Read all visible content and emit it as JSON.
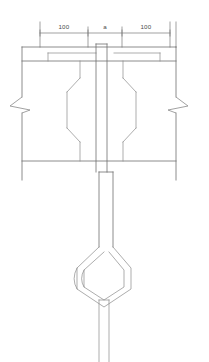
{
  "drawing": {
    "title": "Structural connection detail - section view",
    "units_note": "",
    "line_color": "#6e6e6e",
    "thin_line_color": "#8a8a8a",
    "text_color": "#4a4a4a",
    "background": "#ffffff"
  },
  "dimensions": {
    "chain_label": "dimension-chain",
    "segments": [
      {
        "id": "left",
        "label": "100",
        "x_start": 40,
        "x_end": 88,
        "text_x": 64
      },
      {
        "id": "middle",
        "label": "a",
        "x_start": 88,
        "x_end": 122,
        "text_x": 105
      },
      {
        "id": "right",
        "label": "100",
        "x_start": 122,
        "x_end": 170,
        "text_x": 146
      }
    ],
    "dim_line_y": 33,
    "text_y": 29
  },
  "annotations": {
    "break_symbol_left": "break-line",
    "break_symbol_right": "break-line",
    "stem": "center-stem",
    "plate": "top-plate",
    "void_left": "chamfered-void-left",
    "void_right": "chamfered-void-right",
    "loop": "diamond-loop",
    "lower_shaft": "lower-shaft"
  }
}
